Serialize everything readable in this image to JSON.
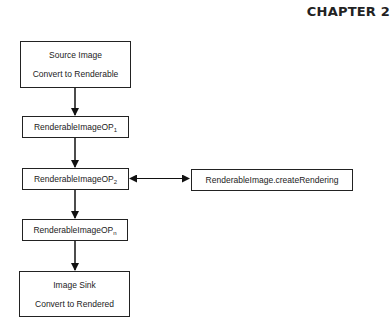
{
  "header": {
    "chapter_label": "CHAPTER",
    "chapter_number": "2"
  },
  "diagram": {
    "nodes": {
      "source": {
        "line1": "Source Image",
        "line2": "Convert to Renderable"
      },
      "op1": {
        "base": "RenderableImageOP",
        "sub": "1"
      },
      "op2": {
        "base": "RenderableImageOP",
        "sub": "2"
      },
      "create_rendering": {
        "label": "RenderableImage.createRendering"
      },
      "opn": {
        "base": "RenderableImageOP",
        "sub": "n"
      },
      "sink": {
        "line1": "Image Sink",
        "line2": "Convert to Rendered"
      }
    },
    "edges": [
      {
        "from": "source",
        "to": "op1",
        "type": "arrow"
      },
      {
        "from": "op1",
        "to": "op2",
        "type": "arrow"
      },
      {
        "from": "op2",
        "to": "create_rendering",
        "type": "bidirectional"
      },
      {
        "from": "op2",
        "to": "opn",
        "type": "arrow"
      },
      {
        "from": "opn",
        "to": "sink",
        "type": "arrow"
      }
    ]
  }
}
